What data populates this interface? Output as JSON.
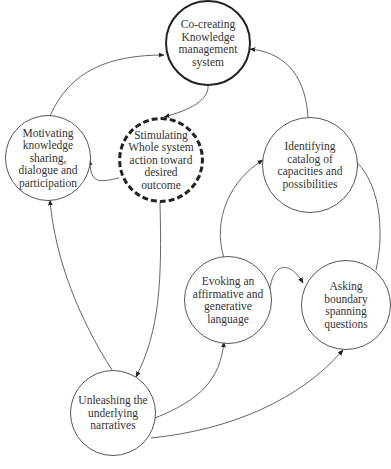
{
  "diagram": {
    "nodes": [
      {
        "id": "co-creating",
        "label": "Co-creating\nKnowledge\nmanagement\nsystem",
        "style": "thick"
      },
      {
        "id": "motivating",
        "label": "Motivating\nknowledge\nsharing,\ndialogue and\nparticipation",
        "style": "normal"
      },
      {
        "id": "stimulating",
        "label": "Stimulating\nWhole system\naction toward\ndesired\noutcome",
        "style": "dashed"
      },
      {
        "id": "identifying",
        "label": "Identifying\ncatalog of\ncapacities  and\npossibilities",
        "style": "normal"
      },
      {
        "id": "evoking",
        "label": "Evoking an\naffirmative and\ngenerative\nlanguage",
        "style": "normal"
      },
      {
        "id": "asking",
        "label": "Asking\nboundary\nspanning\nquestions",
        "style": "normal"
      },
      {
        "id": "unleashing",
        "label": "Unleashing the\nunderlying\nnarratives",
        "style": "normal"
      }
    ],
    "edges": [
      {
        "from": "motivating",
        "to": "co-creating"
      },
      {
        "from": "stimulating",
        "to": "motivating"
      },
      {
        "from": "co-creating",
        "to": "stimulating"
      },
      {
        "from": "identifying",
        "to": "co-creating"
      },
      {
        "from": "stimulating",
        "to": "unleashing"
      },
      {
        "from": "unleashing",
        "to": "motivating"
      },
      {
        "from": "unleashing",
        "to": "evoking"
      },
      {
        "from": "unleashing",
        "to": "asking"
      },
      {
        "from": "evoking",
        "to": "identifying"
      },
      {
        "from": "evoking",
        "to": "asking"
      },
      {
        "from": "asking",
        "to": "identifying"
      }
    ]
  }
}
